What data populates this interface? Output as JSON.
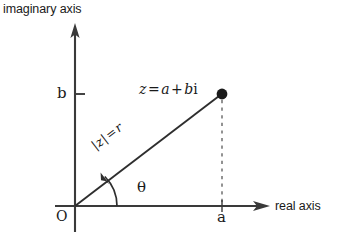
{
  "figure": {
    "background_color": "#ffffff",
    "stroke_color": "#3a3a3a",
    "text_color": "#1a1a1a"
  },
  "axes": {
    "vertical": {
      "name": "imaginary-axis",
      "label": "imaginary axis",
      "x": 75,
      "y_top": 25,
      "y_bottom": 232,
      "arrow": "up"
    },
    "horizontal": {
      "name": "real-axis",
      "label": "real axis",
      "y": 206,
      "x_left": 55,
      "x_right": 270,
      "arrow": "right"
    },
    "origin_label": "O"
  },
  "point": {
    "name": "point-z",
    "label_z": "z",
    "label_equals": "=",
    "label_a": "a",
    "label_plus": "+",
    "label_b": "b",
    "label_i": "i",
    "label_full": "z = a + bi",
    "x": 222,
    "y": 94,
    "marker": "filled-circle",
    "marker_radius": 5
  },
  "ticks": {
    "imaginary": {
      "label": "b",
      "value_y": 94,
      "tick_x_from": 75,
      "tick_x_to": 84
    },
    "real": {
      "label": "a",
      "value_x": 222,
      "tick_y_from": 200,
      "tick_y_to": 212
    }
  },
  "modulus": {
    "name": "modulus-label",
    "bar_open": "|",
    "symbol": "z",
    "bar_close": "|",
    "equals": "=",
    "radius": "r",
    "label_full": "|z| = r",
    "rotation_deg": -37.3
  },
  "angle": {
    "name": "angle-theta",
    "label": "θ",
    "arc_radius": 42,
    "start_x": 117,
    "start_y": 206,
    "arrow": "counterclockwise"
  },
  "dashed_line": {
    "name": "projection-dashed-line",
    "from_x": 222,
    "from_y": 99,
    "to_x": 222,
    "to_y": 206,
    "style": "dashed"
  },
  "radius_line": {
    "name": "radius-vector",
    "from_x": 75,
    "from_y": 206,
    "to_x": 222,
    "to_y": 94
  }
}
